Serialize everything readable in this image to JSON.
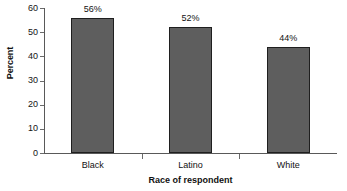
{
  "chart_data": {
    "type": "bar",
    "title": "",
    "subtitle": "",
    "categories": [
      "Black",
      "Latino",
      "White"
    ],
    "values": [
      56,
      52,
      44
    ],
    "data_labels": [
      "56%",
      "52%",
      "44%"
    ],
    "xlabel": "Race of respondent",
    "ylabel": "Percent",
    "ylim": [
      0,
      60
    ],
    "ytick_values": [
      0,
      10,
      20,
      30,
      40,
      50,
      60
    ],
    "ytick_labels": [
      "0",
      "10",
      "20",
      "30",
      "40",
      "50",
      "60"
    ],
    "grid": false,
    "legend": null,
    "legend_position": "none",
    "bar_fill_color": "#5e5e5e",
    "bar_border_color": "#1f1f1f",
    "axis_color": "#595959",
    "background_color": "#ffffff"
  }
}
